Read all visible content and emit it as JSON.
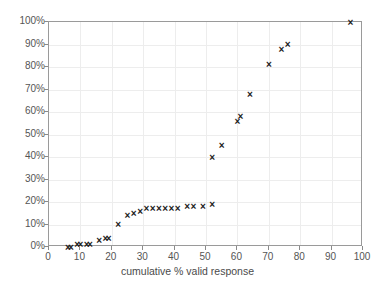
{
  "chart_data": {
    "type": "scatter",
    "title": "",
    "xlabel": "cumulative % valid response",
    "ylabel": "",
    "xlim": [
      0,
      100
    ],
    "ylim": [
      0,
      100
    ],
    "xticks": [
      0,
      10,
      20,
      30,
      40,
      50,
      60,
      70,
      80,
      90,
      100
    ],
    "xticklabels": [
      "0",
      "10",
      "20",
      "30",
      "40",
      "50",
      "60",
      "70",
      "80",
      "90",
      "100"
    ],
    "yticks": [
      0,
      10,
      20,
      30,
      40,
      50,
      60,
      70,
      80,
      90,
      100
    ],
    "yticklabels": [
      "0%",
      "10%",
      "20%",
      "30%",
      "40%",
      "50%",
      "60%",
      "70%",
      "80%",
      "90%",
      "100%"
    ],
    "grid": true,
    "legend": null,
    "marker": "x",
    "marker_color": "#1b1b1b",
    "grid_color": "#ededed",
    "axis_color": "#9a9a9a",
    "series": [
      {
        "name": "cumulative response",
        "points": [
          [
            6,
            0
          ],
          [
            7,
            0
          ],
          [
            9,
            1
          ],
          [
            10,
            1
          ],
          [
            12,
            1
          ],
          [
            13,
            1
          ],
          [
            16,
            3
          ],
          [
            18,
            4
          ],
          [
            19,
            4
          ],
          [
            22,
            10
          ],
          [
            25,
            14
          ],
          [
            27,
            15
          ],
          [
            29,
            16
          ],
          [
            31,
            17
          ],
          [
            33,
            17
          ],
          [
            35,
            17
          ],
          [
            37,
            17
          ],
          [
            39,
            17
          ],
          [
            41,
            17
          ],
          [
            44,
            18
          ],
          [
            46,
            18
          ],
          [
            49,
            18
          ],
          [
            52,
            19
          ],
          [
            52,
            40
          ],
          [
            55,
            45
          ],
          [
            60,
            56
          ],
          [
            61,
            58
          ],
          [
            64,
            68
          ],
          [
            70,
            81
          ],
          [
            74,
            88
          ],
          [
            76,
            90
          ],
          [
            96,
            100
          ]
        ]
      }
    ]
  }
}
